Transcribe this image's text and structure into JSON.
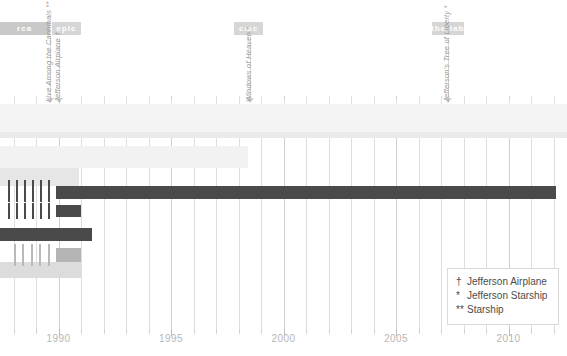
{
  "chart_data": {
    "type": "bar",
    "title": "",
    "subtitle": "",
    "xlabel": "",
    "ylabel": "",
    "xlim": [
      1987.4,
      2012.6
    ],
    "grid": true,
    "orientation": "horizontal-timeline",
    "axis": {
      "tick_labels": [
        "1990",
        "1995",
        "2000",
        "2005",
        "2010"
      ],
      "tick_values": [
        1990,
        1995,
        2000,
        2005,
        2010
      ],
      "minor_tick_step": 1
    },
    "eras": [
      {
        "label": "rca",
        "start": 1987.4,
        "end": 1989.6,
        "color": "#c9c9c9"
      },
      {
        "label": "epic",
        "start": 1989.7,
        "end": 1991.0,
        "color": "#d6d6d6"
      },
      {
        "label": "cmc",
        "start": 1997.8,
        "end": 1999.1,
        "color": "#d6d6d6"
      },
      {
        "label": "the lab",
        "start": 2006.6,
        "end": 2008.0,
        "color": "#d6d6d6"
      }
    ],
    "annotations": [
      {
        "text": "Live Among the Cannibals **",
        "year": 1989.6
      },
      {
        "text": "Jefferson Airplane †",
        "year": 1990.0
      },
      {
        "text": "Windows of Heaven *",
        "year": 1998.5
      },
      {
        "text": "Jefferson's Tree of Liberty *",
        "year": 2007.3
      }
    ],
    "series": [
      {
        "name": "band-row-1",
        "start": 1987.4,
        "end": 2012.6,
        "color": "#f4f4f4",
        "y": 104,
        "height": 28
      },
      {
        "name": "band-row-2",
        "start": 1987.4,
        "end": 2012.6,
        "color": "#eaeaea",
        "y": 132,
        "height": 6
      },
      {
        "name": "band-row-3",
        "start": 1987.4,
        "end": 1998.4,
        "color": "#f2f2f2",
        "y": 146,
        "height": 22
      },
      {
        "name": "band-row-4",
        "start": 1987.4,
        "end": 1990.9,
        "color": "#e6e6e6",
        "y": 168,
        "height": 18
      },
      {
        "name": "bar-dark-1",
        "start": 1989.9,
        "end": 2012.1,
        "color": "#4a4a4a",
        "y": 186,
        "height": 13
      },
      {
        "name": "bar-dark-2",
        "start": 1989.9,
        "end": 1991.0,
        "color": "#4a4a4a",
        "y": 205,
        "height": 12
      },
      {
        "name": "bar-dark-3",
        "start": 1987.4,
        "end": 1991.5,
        "color": "#4a4a4a",
        "y": 228,
        "height": 13
      },
      {
        "name": "bar-gray-1",
        "start": 1989.9,
        "end": 1991.0,
        "color": "#b4b4b4",
        "y": 248,
        "height": 14
      },
      {
        "name": "band-row-5",
        "start": 1987.4,
        "end": 1991.0,
        "color": "#dcdcdc",
        "y": 262,
        "height": 16
      }
    ],
    "hatch_groups": [
      {
        "name": "hatch-1",
        "y": 180,
        "height": 22,
        "color": "#4a4a4a",
        "x_start": 8,
        "x_end": 56,
        "count": 6
      },
      {
        "name": "hatch-2",
        "y": 203,
        "height": 16,
        "color": "#4a4a4a",
        "x_start": 8,
        "x_end": 56,
        "count": 6
      },
      {
        "name": "hatch-3",
        "y": 244,
        "height": 22,
        "color": "#b9b9b9",
        "x_start": 14,
        "x_end": 56,
        "count": 5
      }
    ],
    "legend": {
      "position": "bottom-right",
      "entries": [
        {
          "mark": "†",
          "label": "Jefferson Airplane"
        },
        {
          "mark": "*",
          "label": "Jefferson Starship"
        },
        {
          "mark": "**",
          "label": "Starship"
        }
      ]
    },
    "colors": {
      "dark_bar": "#4a4a4a",
      "mid_bar": "#b4b4b4",
      "light_band": "#f2f2f2",
      "gridline": "#dedede",
      "axis_text": "#b6b6b6",
      "legend_text": "#4c4c4c",
      "era_band": "#d6d6d6"
    }
  }
}
